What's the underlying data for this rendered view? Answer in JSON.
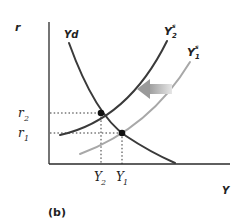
{
  "figure": {
    "panel_label": "(b)",
    "axes": {
      "y_label": "r",
      "x_label": "Y"
    },
    "curves": {
      "demand": {
        "label": "Yd",
        "color": "#3a3a3a"
      },
      "supply_new": {
        "label": "Y",
        "superscript": "s",
        "subscript": "2",
        "color": "#3a3a3a"
      },
      "supply_old": {
        "label": "Y",
        "superscript": "s",
        "subscript": "1",
        "color": "#a8a8a8"
      }
    },
    "ticks": {
      "y": [
        {
          "label": "r",
          "subscript": "2"
        },
        {
          "label": "r",
          "subscript": "1"
        }
      ],
      "x": [
        {
          "label": "Y",
          "subscript": "2"
        },
        {
          "label": "Y",
          "subscript": "1"
        }
      ]
    },
    "shift_arrow": {
      "direction": "left",
      "color": "#bdbdbd"
    }
  }
}
